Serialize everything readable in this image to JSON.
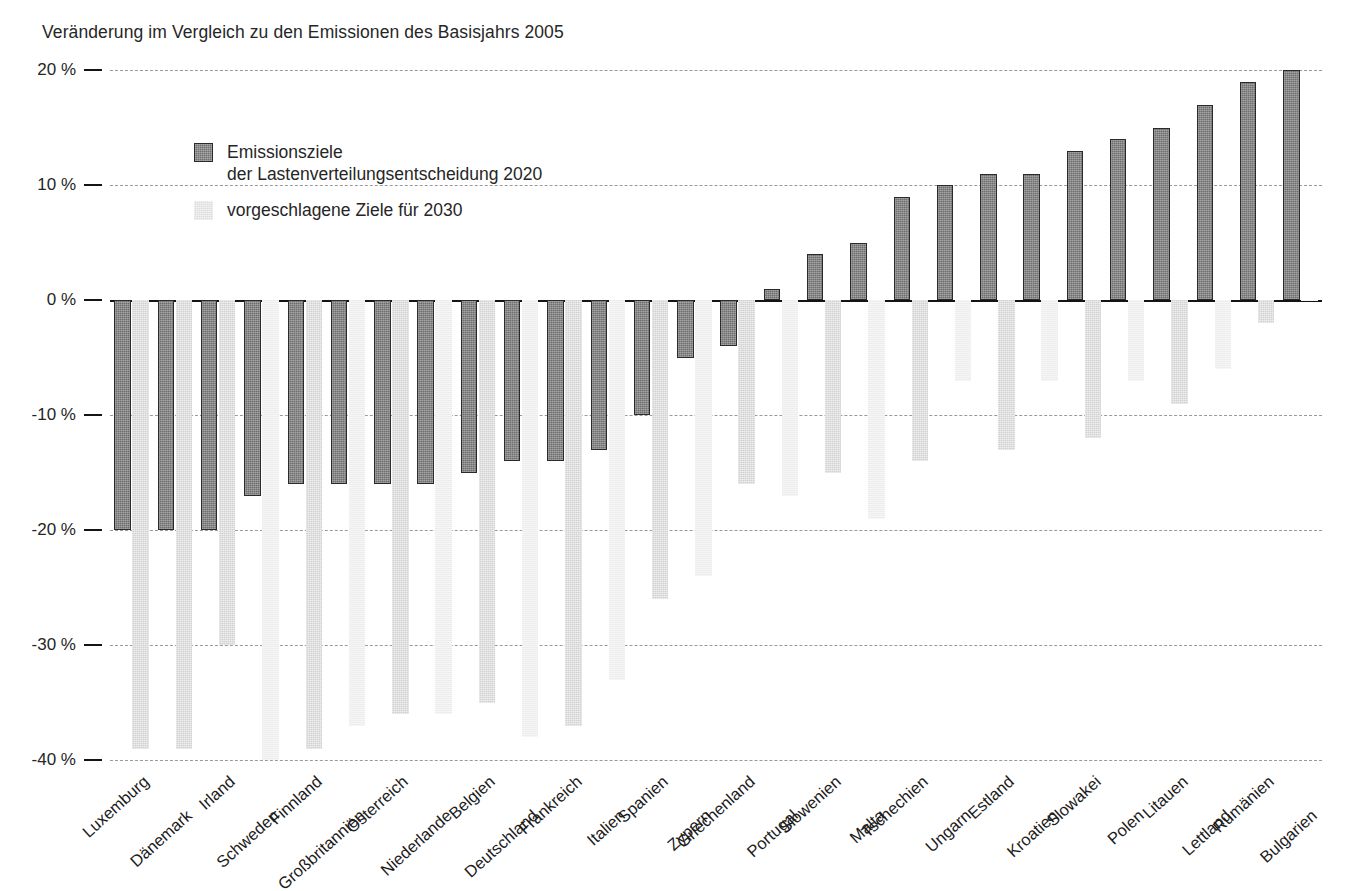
{
  "chart_data": {
    "type": "bar",
    "title": "Veränderung im Vergleich zu den Emissionen des Basisjahrs 2005",
    "xlabel": "",
    "ylabel": "",
    "ylim": [
      -40,
      20
    ],
    "yticks": [
      20,
      10,
      0,
      -10,
      -20,
      -30,
      -40
    ],
    "ytick_labels": [
      "20 %",
      "10 %",
      "0 %",
      "-10 %",
      "-20 %",
      "-30 %",
      "-40 %"
    ],
    "grid": true,
    "legend_position": "upper-left-inside",
    "categories": [
      "Luxemburg",
      "Dänemark",
      "Irland",
      "Schweden",
      "Finnland",
      "Großbritannien",
      "Österreich",
      "Niederlande",
      "Belgien",
      "Deutschland",
      "Frankreich",
      "Italien",
      "Spanien",
      "Zypern",
      "Griechenland",
      "Portugal",
      "Slowenien",
      "Malta",
      "Tschechien",
      "Ungarn",
      "Estland",
      "Kroatien",
      "Slowakei",
      "Polen",
      "Litauen",
      "Lettland",
      "Rumänien",
      "Bulgarien"
    ],
    "series": [
      {
        "name": "Emissionsziele der Lastenverteilungsentscheidung 2020",
        "color": "#6e6e6e",
        "values": [
          -20,
          -20,
          -20,
          -17,
          -16,
          -16,
          -16,
          -16,
          -15,
          -14,
          -14,
          -13,
          -10,
          -5,
          -4,
          1,
          4,
          5,
          9,
          10,
          11,
          11,
          13,
          14,
          15,
          17,
          19,
          20
        ]
      },
      {
        "name": "vorgeschlagene Ziele für 2030",
        "color": "#d2d2d2",
        "values": [
          -39,
          -39,
          -30,
          -40,
          -39,
          -37,
          -36,
          -36,
          -35,
          -38,
          -37,
          -33,
          -26,
          -24,
          -16,
          -17,
          -15,
          -19,
          -14,
          -7,
          -13,
          -7,
          -12,
          -7,
          -9,
          -6,
          -2,
          0
        ]
      }
    ]
  },
  "title": {
    "text": "Veränderung im Vergleich zu den Emissionen des Basisjahrs 2005"
  },
  "legend": {
    "entries": [
      {
        "label": "Emissionsziele\nder Lastenverteilungsentscheidung 2020",
        "swatch": "dark-hatched-swatch"
      },
      {
        "label": "vorgeschlagene Ziele für 2030",
        "swatch": "light-hatched-swatch"
      }
    ]
  },
  "axis": {
    "y_labels": [
      "20 %",
      "10 %",
      "0 %",
      "-10 %",
      "-20 %",
      "-30 %",
      "-40 %"
    ]
  }
}
